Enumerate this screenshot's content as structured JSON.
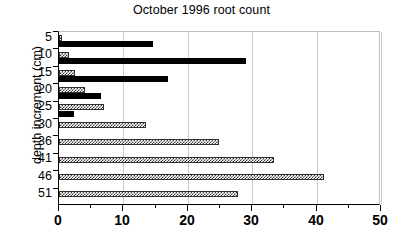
{
  "chart_data": {
    "type": "bar",
    "orientation": "horizontal",
    "title": "October 1996 root count",
    "xlabel": "",
    "ylabel": "depth increment (cm)",
    "categories": [
      "5",
      "10",
      "15",
      "20",
      "25",
      "30",
      "36",
      "41",
      "46",
      "51"
    ],
    "series": [
      {
        "name": "checkered",
        "style": "checker",
        "values": [
          0.5,
          1.5,
          2.5,
          4.0,
          7.0,
          13.5,
          24.8,
          33.4,
          41.1,
          27.8
        ]
      },
      {
        "name": "solid",
        "style": "solid",
        "values": [
          14.6,
          29.0,
          17.0,
          6.5,
          2.3,
          0,
          0,
          0,
          0,
          0
        ]
      }
    ],
    "xlim": [
      0,
      50
    ],
    "xticks": [
      0,
      10,
      20,
      30,
      40,
      50
    ],
    "xticklabels": [
      "0",
      "10",
      "20",
      "30",
      "40",
      "50"
    ],
    "xminorticks": [
      5,
      15,
      25,
      35,
      45
    ],
    "grid": true,
    "grid_axis": "x",
    "legend": null,
    "colors": {
      "solid_bar": "#000000",
      "checker_bar": "#3a3a3a",
      "gridline": "#c9c9c9",
      "axis": "#000000",
      "background": "#ffffff"
    }
  }
}
